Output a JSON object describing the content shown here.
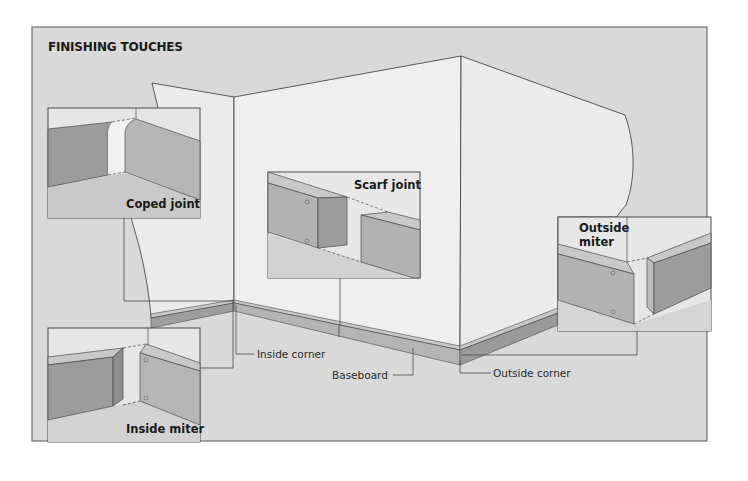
{
  "figure": {
    "title": "FINISHING TOUCHES",
    "colors": {
      "background": "#d9d9d9",
      "frame": "#6e6e6e",
      "wall": "#ebebeb",
      "wall_shadow": "#e2e2e2",
      "board_face_dark": "#9a9a9a",
      "board_face_mid": "#b2b2b2",
      "board_top": "#c8c8c8",
      "line": "#4a4a4a"
    }
  },
  "insets": [
    {
      "id": "coped-joint",
      "label": "Coped joint"
    },
    {
      "id": "scarf-joint",
      "label": "Scarf joint"
    },
    {
      "id": "outside-miter",
      "label_line1": "Outside",
      "label_line2": "miter"
    },
    {
      "id": "inside-miter",
      "label": "Inside miter"
    }
  ],
  "callouts": {
    "inside_corner": "Inside corner",
    "baseboard": "Baseboard",
    "outside_corner": "Outside corner"
  }
}
